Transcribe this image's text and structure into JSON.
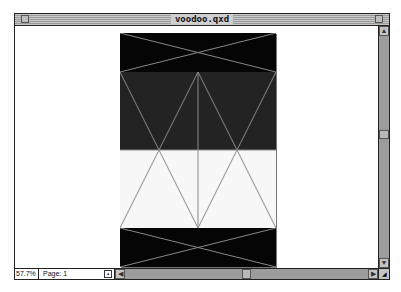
{
  "window": {
    "title": "voodoo.qxd",
    "close_icon": "close-box-icon",
    "zoom_icon": "zoom-box-icon"
  },
  "status": {
    "zoom_level": "57.7%",
    "page_label": "Page: 1",
    "page_nav_icon": "page-nav-icon"
  },
  "scrollbars": {
    "up_arrow": "▲",
    "down_arrow": "▼",
    "left_arrow": "◀",
    "right_arrow": "▶",
    "vertical_position": 0.45,
    "horizontal_position": 0.5
  },
  "document": {
    "sections": [
      {
        "name": "top-band",
        "fill": "#050505"
      },
      {
        "name": "upper-panel",
        "fill": "#232323"
      },
      {
        "name": "lower-panel",
        "fill": "#f7f7f7"
      },
      {
        "name": "bottom-band",
        "fill": "#050505"
      }
    ],
    "line_color": "#8a8a8a"
  }
}
